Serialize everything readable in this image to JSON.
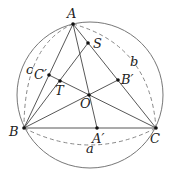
{
  "diagram": {
    "type": "geometry",
    "circle": {
      "cx": 90,
      "cy": 95,
      "r": 73
    },
    "points": {
      "A": {
        "label": "A",
        "x": 73,
        "y": 24,
        "lx": 67,
        "ly": 18
      },
      "S": {
        "label": "S",
        "x": 88,
        "y": 43,
        "lx": 93,
        "ly": 48
      },
      "C_prime": {
        "label": "C′",
        "x": 49,
        "y": 75,
        "lx": 34,
        "ly": 79
      },
      "T": {
        "label": "T",
        "x": 60,
        "y": 81,
        "lx": 55,
        "ly": 95
      },
      "B_prime": {
        "label": "B′",
        "x": 118,
        "y": 80,
        "lx": 121,
        "ly": 84
      },
      "O": {
        "label": "O",
        "x": 89,
        "y": 95,
        "lx": 80,
        "ly": 108
      },
      "B": {
        "label": "B",
        "x": 24,
        "y": 128,
        "lx": 9,
        "ly": 136
      },
      "A_prime": {
        "label": "A′",
        "x": 97,
        "y": 128,
        "lx": 92,
        "ly": 143
      },
      "C": {
        "label": "C",
        "x": 156,
        "y": 128,
        "lx": 150,
        "ly": 143
      }
    },
    "arc_labels": {
      "a": {
        "label": "a",
        "x": 86,
        "y": 153
      },
      "b": {
        "label": "b",
        "x": 130,
        "y": 66
      },
      "c": {
        "label": "c",
        "x": 26,
        "y": 74
      }
    }
  }
}
